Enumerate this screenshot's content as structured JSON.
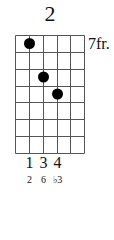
{
  "diagram": {
    "title": "2",
    "fret_position": "7fr.",
    "strings": 6,
    "frets": 7,
    "dots": [
      {
        "string": 2,
        "fret": 1
      },
      {
        "string": 3,
        "fret": 3
      },
      {
        "string": 4,
        "fret": 4
      }
    ],
    "fingers": [
      "1",
      "3",
      "4"
    ],
    "intervals": [
      "2",
      "6",
      "♭3"
    ],
    "line_color": "#555555",
    "dot_color": "#000000"
  }
}
